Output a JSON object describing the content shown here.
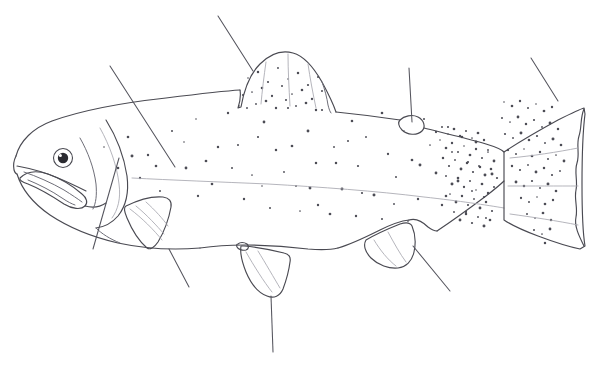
{
  "document": {
    "title": "Fish External Anatomy — Unlabeled Worksheet",
    "subject": "Trout / Salmon lateral view line drawing",
    "style": "pencil line art, black and white",
    "width": 596,
    "height": 367,
    "background_color": "#ffffff",
    "line_color": "#4a4a52",
    "spot_color": "#4c4c55",
    "has_visible_text": false,
    "label_text": ""
  },
  "fish": {
    "species_appearance": "rainbow trout",
    "orientation": "facing left",
    "parts": [
      {
        "id": "snout",
        "name": "snout"
      },
      {
        "id": "mouth",
        "name": "mouth with hooked jaw (kype)"
      },
      {
        "id": "eye",
        "name": "eye"
      },
      {
        "id": "operculum",
        "name": "operculum (gill cover)"
      },
      {
        "id": "dorsal-fin",
        "name": "dorsal fin"
      },
      {
        "id": "adipose-fin",
        "name": "adipose fin"
      },
      {
        "id": "caudal-fin",
        "name": "caudal fin (tail)"
      },
      {
        "id": "anal-fin",
        "name": "anal fin"
      },
      {
        "id": "pelvic-fin",
        "name": "pelvic fin"
      },
      {
        "id": "pectoral-fin",
        "name": "pectoral fin"
      },
      {
        "id": "lateral-line",
        "name": "lateral line"
      },
      {
        "id": "caudal-peduncle",
        "name": "caudal peduncle"
      }
    ]
  },
  "leader_lines": [
    {
      "id": "leader-dorsal-fin",
      "target": "dorsal fin",
      "x1": 218,
      "y1": 16,
      "x2": 253,
      "y2": 71,
      "label": ""
    },
    {
      "id": "leader-lateral-line",
      "target": "lateral line",
      "x1": 110,
      "y1": 66,
      "x2": 175,
      "y2": 167,
      "label": ""
    },
    {
      "id": "leader-adipose-fin",
      "target": "adipose fin",
      "x1": 409,
      "y1": 68,
      "x2": 412,
      "y2": 122,
      "label": ""
    },
    {
      "id": "leader-caudal-fin",
      "target": "caudal fin",
      "x1": 531,
      "y1": 58,
      "x2": 558,
      "y2": 101,
      "label": ""
    },
    {
      "id": "leader-operculum",
      "target": "operculum",
      "x1": 119,
      "y1": 158,
      "x2": 93,
      "y2": 249,
      "label": ""
    },
    {
      "id": "leader-pectoral-fin",
      "target": "pectoral fin",
      "x1": 169,
      "y1": 249,
      "x2": 189,
      "y2": 287,
      "label": ""
    },
    {
      "id": "leader-pelvic-fin",
      "target": "pelvic fin",
      "x1": 271,
      "y1": 296,
      "x2": 273,
      "y2": 352,
      "label": ""
    },
    {
      "id": "leader-anal-fin",
      "target": "anal fin",
      "x1": 413,
      "y1": 246,
      "x2": 450,
      "y2": 291,
      "label": ""
    }
  ],
  "spots": {
    "body_spot_count": 74,
    "tail_spot_count": 58,
    "peduncle_spot_count": 52,
    "dorsal_fin_spot_count": 26,
    "radius_min": 0.8,
    "radius_max": 1.5,
    "body": [
      [
        104,
        147
      ],
      [
        128,
        137
      ],
      [
        148,
        155
      ],
      [
        172,
        131
      ],
      [
        196,
        119
      ],
      [
        206,
        161
      ],
      [
        228,
        113
      ],
      [
        238,
        145
      ],
      [
        252,
        175
      ],
      [
        264,
        122
      ],
      [
        276,
        150
      ],
      [
        288,
        108
      ],
      [
        296,
        186
      ],
      [
        308,
        131
      ],
      [
        316,
        163
      ],
      [
        322,
        110
      ],
      [
        334,
        147
      ],
      [
        342,
        189
      ],
      [
        352,
        121
      ],
      [
        358,
        166
      ],
      [
        366,
        137
      ],
      [
        374,
        195
      ],
      [
        382,
        113
      ],
      [
        388,
        154
      ],
      [
        396,
        177
      ],
      [
        404,
        131
      ],
      [
        412,
        160
      ],
      [
        418,
        199
      ],
      [
        424,
        119
      ],
      [
        430,
        145
      ],
      [
        436,
        173
      ],
      [
        442,
        205
      ],
      [
        448,
        127
      ],
      [
        452,
        152
      ],
      [
        458,
        181
      ],
      [
        462,
        137
      ],
      [
        468,
        162
      ],
      [
        472,
        191
      ],
      [
        476,
        142
      ],
      [
        480,
        167
      ],
      [
        484,
        197
      ],
      [
        488,
        150
      ],
      [
        492,
        174
      ],
      [
        118,
        168
      ],
      [
        140,
        178
      ],
      [
        160,
        191
      ],
      [
        184,
        142
      ],
      [
        212,
        184
      ],
      [
        244,
        199
      ],
      [
        270,
        208
      ],
      [
        300,
        211
      ],
      [
        330,
        214
      ],
      [
        356,
        216
      ],
      [
        382,
        219
      ],
      [
        408,
        221
      ],
      [
        186,
        168
      ],
      [
        218,
        147
      ],
      [
        258,
        137
      ],
      [
        284,
        172
      ],
      [
        310,
        188
      ],
      [
        336,
        163
      ],
      [
        362,
        193
      ],
      [
        394,
        204
      ],
      [
        420,
        165
      ],
      [
        446,
        196
      ],
      [
        466,
        212
      ],
      [
        486,
        218
      ],
      [
        132,
        156
      ],
      [
        156,
        166
      ],
      [
        198,
        196
      ],
      [
        232,
        168
      ],
      [
        262,
        186
      ],
      [
        292,
        146
      ],
      [
        318,
        205
      ],
      [
        348,
        141
      ]
    ],
    "peduncle_dense": [
      [
        440,
        140
      ],
      [
        446,
        148
      ],
      [
        452,
        143
      ],
      [
        458,
        152
      ],
      [
        464,
        146
      ],
      [
        470,
        155
      ],
      [
        476,
        149
      ],
      [
        482,
        158
      ],
      [
        488,
        152
      ],
      [
        494,
        161
      ],
      [
        443,
        158
      ],
      [
        449,
        166
      ],
      [
        455,
        160
      ],
      [
        461,
        169
      ],
      [
        467,
        163
      ],
      [
        473,
        172
      ],
      [
        479,
        166
      ],
      [
        485,
        175
      ],
      [
        491,
        169
      ],
      [
        497,
        178
      ],
      [
        446,
        176
      ],
      [
        452,
        184
      ],
      [
        458,
        178
      ],
      [
        464,
        187
      ],
      [
        470,
        181
      ],
      [
        476,
        190
      ],
      [
        482,
        184
      ],
      [
        488,
        193
      ],
      [
        494,
        187
      ],
      [
        450,
        194
      ],
      [
        456,
        202
      ],
      [
        462,
        196
      ],
      [
        468,
        205
      ],
      [
        474,
        199
      ],
      [
        480,
        208
      ],
      [
        486,
        202
      ],
      [
        492,
        211
      ],
      [
        454,
        212
      ],
      [
        460,
        220
      ],
      [
        466,
        214
      ],
      [
        472,
        223
      ],
      [
        478,
        217
      ],
      [
        484,
        226
      ],
      [
        490,
        220
      ],
      [
        436,
        132
      ],
      [
        442,
        127
      ],
      [
        448,
        134
      ],
      [
        454,
        129
      ],
      [
        460,
        136
      ],
      [
        466,
        131
      ],
      [
        472,
        138
      ],
      [
        478,
        133
      ],
      [
        484,
        140
      ]
    ],
    "tail": [
      [
        504,
        102
      ],
      [
        512,
        106
      ],
      [
        520,
        101
      ],
      [
        528,
        108
      ],
      [
        536,
        104
      ],
      [
        544,
        111
      ],
      [
        552,
        107
      ],
      [
        502,
        118
      ],
      [
        510,
        122
      ],
      [
        518,
        117
      ],
      [
        526,
        124
      ],
      [
        534,
        120
      ],
      [
        542,
        127
      ],
      [
        550,
        123
      ],
      [
        558,
        129
      ],
      [
        505,
        134
      ],
      [
        513,
        138
      ],
      [
        521,
        133
      ],
      [
        529,
        140
      ],
      [
        537,
        136
      ],
      [
        545,
        143
      ],
      [
        553,
        139
      ],
      [
        561,
        145
      ],
      [
        508,
        150
      ],
      [
        516,
        154
      ],
      [
        524,
        149
      ],
      [
        532,
        156
      ],
      [
        540,
        152
      ],
      [
        548,
        159
      ],
      [
        556,
        155
      ],
      [
        564,
        161
      ],
      [
        512,
        166
      ],
      [
        520,
        170
      ],
      [
        528,
        165
      ],
      [
        536,
        172
      ],
      [
        544,
        168
      ],
      [
        552,
        175
      ],
      [
        560,
        171
      ],
      [
        516,
        182
      ],
      [
        524,
        186
      ],
      [
        532,
        181
      ],
      [
        540,
        188
      ],
      [
        548,
        184
      ],
      [
        556,
        191
      ],
      [
        521,
        198
      ],
      [
        529,
        202
      ],
      [
        537,
        197
      ],
      [
        545,
        204
      ],
      [
        553,
        200
      ],
      [
        527,
        214
      ],
      [
        535,
        218
      ],
      [
        543,
        213
      ],
      [
        551,
        220
      ],
      [
        534,
        230
      ],
      [
        542,
        234
      ],
      [
        550,
        229
      ],
      [
        545,
        243
      ]
    ],
    "dorsal_fin": [
      [
        248,
        78
      ],
      [
        258,
        72
      ],
      [
        268,
        82
      ],
      [
        278,
        68
      ],
      [
        288,
        79
      ],
      [
        298,
        73
      ],
      [
        308,
        85
      ],
      [
        318,
        77
      ],
      [
        252,
        92
      ],
      [
        262,
        88
      ],
      [
        272,
        96
      ],
      [
        282,
        86
      ],
      [
        292,
        94
      ],
      [
        302,
        90
      ],
      [
        312,
        99
      ],
      [
        322,
        91
      ],
      [
        256,
        104
      ],
      [
        266,
        101
      ],
      [
        276,
        108
      ],
      [
        286,
        100
      ],
      [
        296,
        106
      ],
      [
        306,
        103
      ],
      [
        316,
        110
      ],
      [
        243,
        95
      ],
      [
        247,
        108
      ],
      [
        239,
        106
      ]
    ]
  }
}
